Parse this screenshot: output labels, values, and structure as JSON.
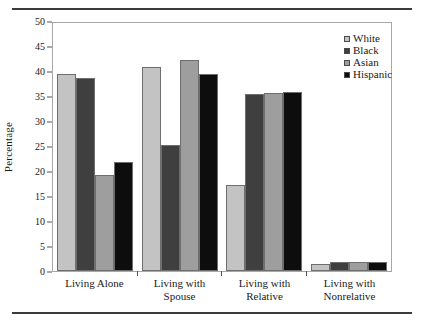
{
  "chart_data": {
    "type": "bar",
    "title": "",
    "xlabel": "",
    "ylabel": "Percentage",
    "ylim": [
      0,
      50
    ],
    "yticks": [
      0,
      5,
      10,
      15,
      20,
      25,
      30,
      35,
      40,
      45,
      50
    ],
    "grid": false,
    "legend_position": "top-right",
    "categories": [
      "Living Alone",
      "Living with Spouse",
      "Living with Relative",
      "Living with Nonrelative"
    ],
    "series": [
      {
        "name": "White",
        "color": "#c3c3c3",
        "values": [
          39.8,
          41.2,
          17.4,
          1.5
        ]
      },
      {
        "name": "Black",
        "color": "#3f3f3f",
        "values": [
          39.0,
          25.4,
          35.6,
          1.8
        ]
      },
      {
        "name": "Asian",
        "color": "#9e9e9e",
        "values": [
          19.4,
          42.6,
          35.8,
          1.9
        ]
      },
      {
        "name": "Hispanic",
        "color": "#0d0d0d",
        "values": [
          22.0,
          39.8,
          36.0,
          1.9
        ]
      }
    ]
  },
  "legend": {
    "items": [
      {
        "label": "White",
        "color": "#c3c3c3"
      },
      {
        "label": "Black",
        "color": "#3f3f3f"
      },
      {
        "label": "Asian",
        "color": "#9e9e9e"
      },
      {
        "label": "Hispanic",
        "color": "#0d0d0d"
      }
    ]
  }
}
